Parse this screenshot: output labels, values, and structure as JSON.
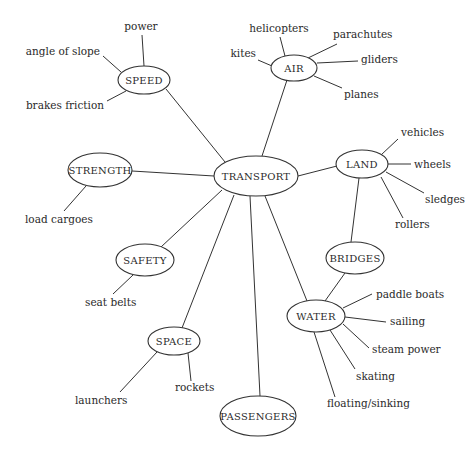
{
  "diagram": {
    "type": "mind-map",
    "center": {
      "label": "TRANSPORT"
    },
    "nodes": [
      {
        "id": "speed",
        "label": "SPEED",
        "leaves": [
          "power",
          "angle of slope",
          "brakes friction"
        ]
      },
      {
        "id": "air",
        "label": "AIR",
        "leaves": [
          "helicopters",
          "kites",
          "parachutes",
          "gliders",
          "planes"
        ]
      },
      {
        "id": "strength",
        "label": "STRENGTH",
        "leaves": [
          "load cargoes"
        ]
      },
      {
        "id": "land",
        "label": "LAND",
        "leaves": [
          "vehicles",
          "wheels",
          "sledges",
          "rollers"
        ]
      },
      {
        "id": "safety",
        "label": "SAFETY",
        "leaves": [
          "seat belts"
        ]
      },
      {
        "id": "bridges",
        "label": "BRIDGES",
        "leaves": []
      },
      {
        "id": "water",
        "label": "WATER",
        "leaves": [
          "paddle boats",
          "sailing",
          "steam power",
          "skating",
          "floating/sinking"
        ]
      },
      {
        "id": "space",
        "label": "SPACE",
        "leaves": [
          "launchers",
          "rockets"
        ]
      },
      {
        "id": "passengers",
        "label": "PASSENGERS",
        "leaves": []
      }
    ],
    "extra_links": [
      {
        "from": "LAND",
        "to": "BRIDGES"
      },
      {
        "from": "BRIDGES",
        "to": "WATER"
      }
    ]
  }
}
